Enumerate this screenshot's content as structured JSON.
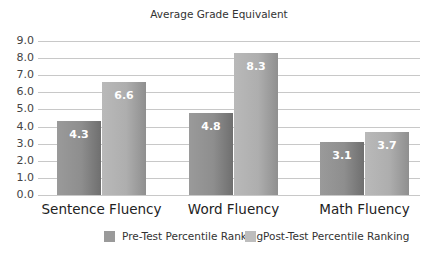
{
  "chart_data": {
    "type": "bar",
    "title": "Average Grade Equivalent",
    "xlabel": "",
    "ylabel": "",
    "ylim": [
      0,
      9
    ],
    "yticks": [
      "0.0",
      "1.0",
      "2.0",
      "3.0",
      "4.0",
      "5.0",
      "6.0",
      "7.0",
      "8.0",
      "9.0"
    ],
    "categories": [
      "Sentence Fluency",
      "Word Fluency",
      "Math Fluency"
    ],
    "series": [
      {
        "name": "Pre-Test Percentile Ranking",
        "values": [
          4.3,
          4.8,
          3.1
        ],
        "labels": [
          "4.3",
          "4.8",
          "3.1"
        ],
        "color": "#959595"
      },
      {
        "name": "Post-Test Percentile Ranking",
        "values": [
          6.6,
          8.3,
          3.7
        ],
        "labels": [
          "6.6",
          "8.3",
          "3.7"
        ],
        "color": "#b5b5b5"
      }
    ],
    "grid": true,
    "legend_position": "bottom"
  }
}
